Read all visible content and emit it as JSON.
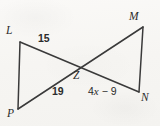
{
  "figure": {
    "kind": "geometry-diagram",
    "background_color": "#f8f7f5",
    "stroke_color": "#3a3a3a",
    "text_color": "#2b2b2b",
    "vertices": [
      {
        "id": "L",
        "label": "L",
        "x": 20,
        "y": 42
      },
      {
        "id": "M",
        "label": "M",
        "x": 143,
        "y": 27
      },
      {
        "id": "N",
        "label": "N",
        "x": 139,
        "y": 92
      },
      {
        "id": "P",
        "label": "P",
        "x": 18,
        "y": 109
      },
      {
        "id": "Z",
        "label": "Z",
        "x": 80,
        "y": 68
      }
    ],
    "segments": [
      {
        "id": "LP",
        "from": "L",
        "to": "P",
        "label": null
      },
      {
        "id": "MN",
        "from": "M",
        "to": "N",
        "label": null
      },
      {
        "id": "LN",
        "from": "L",
        "to": "N",
        "label": null
      },
      {
        "id": "PM",
        "from": "P",
        "to": "M",
        "label": null
      }
    ],
    "measures": [
      {
        "id": "LZ",
        "segment": "L-Z",
        "text": "15",
        "type": "number"
      },
      {
        "id": "PZ",
        "segment": "P-Z",
        "text": "19",
        "type": "number"
      },
      {
        "id": "ZN",
        "segment": "Z-N",
        "text": "4x - 9",
        "type": "expression",
        "coefficient": "4",
        "variable": "x",
        "operator": "−",
        "constant": "9"
      }
    ]
  },
  "labels": {
    "L": "L",
    "M": "M",
    "N": "N",
    "P": "P",
    "Z": "Z",
    "measure_15": "15",
    "measure_19": "19",
    "expr_coefficient": "4",
    "expr_variable": "x",
    "expr_operator": "−",
    "expr_constant": "9"
  }
}
